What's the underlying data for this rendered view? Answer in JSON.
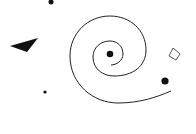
{
  "diagram": {
    "background": "#ffffff",
    "ink_color": "#111111",
    "title": "",
    "elements": [
      {
        "kind": "dot",
        "name": "top-dot",
        "cx": 51,
        "cy": 2,
        "r": 2.5
      },
      {
        "kind": "triangle",
        "name": "left-triangle",
        "points": "10,46 38,38 27,52"
      },
      {
        "kind": "dot",
        "name": "small-dot",
        "cx": 45,
        "cy": 92,
        "r": 1.6
      },
      {
        "kind": "spiral",
        "name": "spiral",
        "stroke_width": 1
      },
      {
        "kind": "dot",
        "name": "spiral-center-dot",
        "cx": 110,
        "cy": 54,
        "r": 3.3
      },
      {
        "kind": "dot",
        "name": "right-dot",
        "cx": 165,
        "cy": 81,
        "r": 3.6
      },
      {
        "kind": "diamond",
        "name": "outline-diamond",
        "points": "173,48 180,54 176,60 169,56"
      }
    ]
  }
}
